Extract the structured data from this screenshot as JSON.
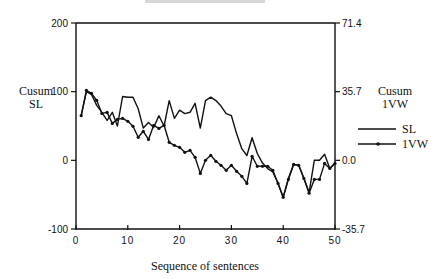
{
  "chart_data": {
    "type": "line",
    "title": "",
    "xlabel": "Sequence of sentences",
    "ylabel_left": "Cusum SL",
    "ylabel_right": "Cusum 1VW",
    "xlim": [
      0,
      50
    ],
    "ylim_left": [
      -100,
      200
    ],
    "ylim_right": [
      -35.7,
      71.4
    ],
    "x_ticks": [
      0,
      10,
      20,
      30,
      40,
      50
    ],
    "y_ticks_left": [
      -100,
      0,
      100,
      200
    ],
    "y_ticks_right": [
      -35.7,
      0.0,
      35.7,
      71.4
    ],
    "y_tick_labels_right": [
      "-35.7",
      "0.0",
      "35.7",
      "71.4"
    ],
    "grid": false,
    "legend_position": "right",
    "x": [
      1,
      2,
      3,
      4,
      5,
      6,
      7,
      8,
      9,
      10,
      11,
      12,
      13,
      14,
      15,
      16,
      17,
      18,
      19,
      20,
      21,
      22,
      23,
      24,
      25,
      26,
      27,
      28,
      29,
      30,
      31,
      32,
      33,
      34,
      35,
      36,
      37,
      38,
      39,
      40,
      41,
      42,
      43,
      44,
      45,
      46,
      47,
      48,
      49,
      50
    ],
    "series": [
      {
        "name": "SL",
        "axis": "left",
        "marker": "none",
        "values": [
          65,
          100,
          96,
          80,
          70,
          58,
          70,
          50,
          93,
          92,
          92,
          75,
          47,
          55,
          48,
          65,
          50,
          87,
          61,
          73,
          68,
          70,
          83,
          47,
          87,
          92,
          87,
          79,
          68,
          65,
          39,
          17,
          7,
          33,
          10,
          -4,
          -12,
          -17,
          -33,
          -54,
          -26,
          -6,
          -7,
          -26,
          -47,
          0,
          0,
          9,
          -12,
          -4
        ]
      },
      {
        "name": "1VW",
        "axis": "right",
        "marker": "dot",
        "values": [
          23.2,
          36.4,
          34.8,
          31.2,
          24.4,
          24.9,
          19.2,
          21.3,
          21.8,
          20.3,
          17.7,
          12.0,
          15.1,
          10.9,
          18.2,
          16.6,
          18.2,
          9.4,
          7.8,
          6.8,
          4.2,
          5.2,
          1.6,
          -6.8,
          0.0,
          2.6,
          -0.5,
          -2.6,
          -5.2,
          -2.6,
          -5.7,
          -8.3,
          -12.0,
          2.1,
          -3.1,
          -3.1,
          -3.1,
          -5.2,
          -12.0,
          -19.2,
          -9.9,
          -2.1,
          -2.6,
          -9.4,
          -17.1,
          -9.9,
          -9.9,
          -1.6,
          -4.2,
          -1.6
        ]
      }
    ]
  },
  "labels": {
    "left_axis_line1": "Cusum",
    "left_axis_line2": "SL",
    "right_axis_line1": "Cusum",
    "right_axis_line2": "1VW",
    "x_axis": "Sequence of sentences",
    "legend_sl": "SL",
    "legend_1vw": "1VW"
  },
  "colors": {
    "line": "#111111",
    "background": "#ffffff"
  }
}
